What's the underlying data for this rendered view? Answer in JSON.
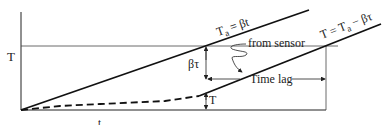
{
  "diagram": {
    "y_axis_label": "T",
    "x_axis_label": "t",
    "ambient_line_label": "T",
    "ambient_line_label_sub": "a",
    "ambient_line_label_rest": " = βt",
    "sensor_line_label_pre": "T = T",
    "sensor_line_label_sub": "a",
    "sensor_line_label_rest": " − βτ",
    "from_sensor_label": "from sensor",
    "offset_label": "βτ",
    "time_lag_label": "Time lag",
    "sensor_temp_label": "T",
    "colors": {
      "line": "#111111",
      "thin": "#333333",
      "background": "#ffffff"
    }
  }
}
